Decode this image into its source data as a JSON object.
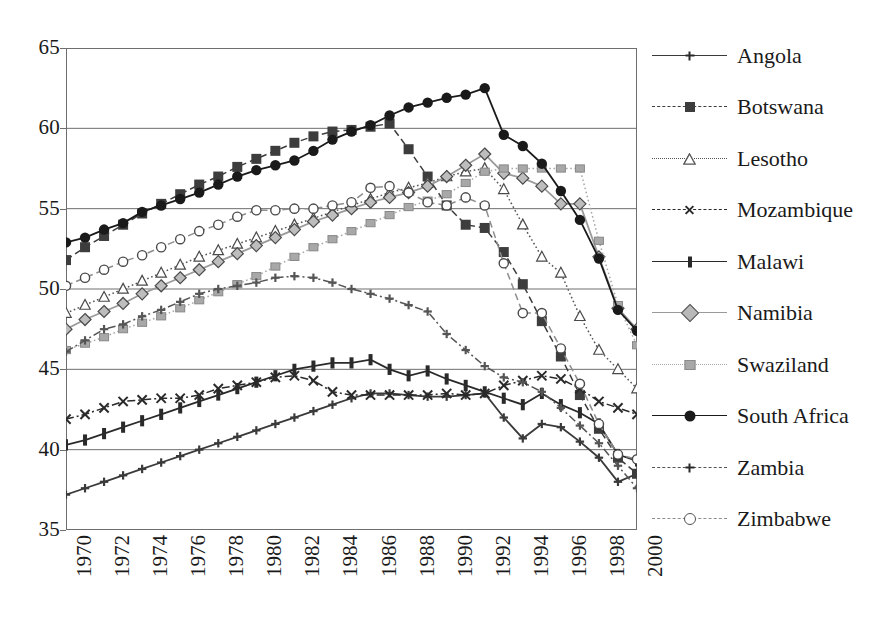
{
  "chart_data": {
    "type": "line",
    "title": "",
    "xlabel": "",
    "ylabel": "",
    "xlim": [
      1970,
      2000
    ],
    "ylim": [
      35,
      65
    ],
    "yticks": [
      35,
      40,
      45,
      50,
      55,
      60,
      65
    ],
    "xticks": [
      1970,
      1972,
      1974,
      1976,
      1978,
      1980,
      1982,
      1984,
      1986,
      1988,
      1990,
      1992,
      1994,
      1996,
      1998,
      2000
    ],
    "grid": true,
    "legend_position": "right",
    "x": [
      1970,
      1971,
      1972,
      1973,
      1974,
      1975,
      1976,
      1977,
      1978,
      1979,
      1980,
      1981,
      1982,
      1983,
      1984,
      1985,
      1986,
      1987,
      1988,
      1989,
      1990,
      1991,
      1992,
      1993,
      1994,
      1995,
      1996,
      1997,
      1998,
      1999,
      2000
    ],
    "series": [
      {
        "name": "Angola",
        "marker": "plus",
        "dash": "solid",
        "color": "#3a3a3a",
        "values": [
          37.2,
          37.6,
          38.0,
          38.4,
          38.8,
          39.2,
          39.6,
          40.0,
          40.4,
          40.8,
          41.2,
          41.6,
          42.0,
          42.4,
          42.8,
          43.2,
          43.5,
          43.5,
          43.4,
          43.3,
          43.3,
          43.4,
          43.5,
          42.0,
          40.7,
          41.6,
          41.4,
          40.5,
          39.5,
          38.0,
          38.5
        ]
      },
      {
        "name": "Botswana",
        "marker": "filled-square",
        "dash": "dashed",
        "color": "#3d3d3d",
        "values": [
          51.8,
          52.6,
          53.3,
          54.0,
          54.7,
          55.3,
          55.9,
          56.5,
          57.0,
          57.6,
          58.1,
          58.6,
          59.1,
          59.5,
          59.8,
          59.9,
          60.1,
          60.3,
          58.7,
          57.0,
          55.2,
          54.0,
          53.8,
          52.3,
          50.3,
          48.0,
          45.8,
          43.4,
          41.3,
          39.5,
          38.5
        ]
      },
      {
        "name": "Lesotho",
        "marker": "open-triangle",
        "dash": "dotted",
        "color": "#555555",
        "values": [
          48.5,
          49.0,
          49.5,
          50.0,
          50.5,
          51.0,
          51.5,
          52.0,
          52.4,
          52.8,
          53.2,
          53.6,
          54.0,
          54.4,
          54.8,
          55.2,
          55.6,
          56.0,
          56.3,
          56.6,
          57.0,
          57.3,
          57.5,
          56.2,
          54.0,
          52.0,
          51.0,
          48.3,
          46.2,
          45.0,
          43.8
        ]
      },
      {
        "name": "Mozambique",
        "marker": "x",
        "dash": "dash-dot",
        "color": "#2a2a2a",
        "values": [
          41.9,
          42.2,
          42.6,
          43.0,
          43.1,
          43.2,
          43.2,
          43.4,
          43.8,
          44.0,
          44.2,
          44.5,
          44.6,
          44.3,
          43.6,
          43.4,
          43.4,
          43.4,
          43.4,
          43.4,
          43.5,
          43.4,
          43.5,
          44.0,
          44.3,
          44.6,
          44.4,
          43.8,
          43.0,
          42.6,
          42.2
        ]
      },
      {
        "name": "Malawi",
        "marker": "vbar",
        "dash": "solid",
        "color": "#2a2a2a",
        "values": [
          40.3,
          40.6,
          41.0,
          41.4,
          41.8,
          42.2,
          42.6,
          43.0,
          43.4,
          43.8,
          44.2,
          44.6,
          45.0,
          45.2,
          45.4,
          45.4,
          45.6,
          45.0,
          44.6,
          44.9,
          44.4,
          44.0,
          43.6,
          43.2,
          42.8,
          43.5,
          42.8,
          42.3,
          41.6,
          39.7,
          39.3
        ]
      },
      {
        "name": "Namibia",
        "marker": "diamond",
        "dash": "solid",
        "color": "#9a9a9a",
        "values": [
          47.5,
          48.1,
          48.6,
          49.1,
          49.7,
          50.2,
          50.7,
          51.2,
          51.7,
          52.2,
          52.7,
          53.2,
          53.7,
          54.2,
          54.6,
          55.0,
          55.4,
          55.7,
          56.0,
          56.4,
          57.0,
          57.7,
          58.4,
          57.2,
          56.9,
          56.4,
          55.3,
          55.3,
          52.0,
          48.8,
          47.5
        ]
      },
      {
        "name": "Swaziland",
        "marker": "gray-square",
        "dash": "dotted",
        "color": "#a8a8a8",
        "values": [
          46.2,
          46.6,
          47.0,
          47.5,
          47.9,
          48.3,
          48.8,
          49.3,
          49.8,
          50.3,
          50.8,
          51.4,
          52.0,
          52.6,
          53.1,
          53.6,
          54.1,
          54.6,
          55.1,
          55.5,
          55.9,
          56.6,
          57.3,
          57.5,
          57.5,
          57.5,
          57.5,
          57.5,
          53.0,
          49.0,
          46.5
        ]
      },
      {
        "name": "South Africa",
        "marker": "filled-circle",
        "dash": "solid",
        "color": "#1a1a1a",
        "values": [
          52.9,
          53.2,
          53.7,
          54.1,
          54.8,
          55.2,
          55.6,
          56.0,
          56.5,
          57.0,
          57.4,
          57.7,
          58.0,
          58.6,
          59.3,
          59.8,
          60.2,
          60.8,
          61.3,
          61.6,
          61.9,
          62.1,
          62.5,
          59.6,
          58.9,
          57.8,
          56.1,
          54.3,
          51.9,
          48.7,
          47.4
        ]
      },
      {
        "name": "Zambia",
        "marker": "plus",
        "dash": "dash-dot",
        "color": "#555555",
        "values": [
          46.1,
          46.8,
          47.5,
          47.8,
          48.3,
          48.7,
          49.2,
          49.7,
          50.0,
          50.2,
          50.4,
          50.7,
          50.8,
          50.7,
          50.4,
          50.0,
          49.7,
          49.4,
          49.0,
          48.6,
          47.2,
          46.2,
          45.2,
          44.5,
          44.2,
          43.6,
          42.6,
          41.5,
          40.4,
          39.0,
          37.6
        ]
      },
      {
        "name": "Zimbabwe",
        "marker": "open-circle",
        "dash": "dashed",
        "color": "#8d8d8d",
        "values": [
          50.2,
          50.7,
          51.2,
          51.7,
          52.1,
          52.6,
          53.1,
          53.6,
          54.0,
          54.5,
          54.9,
          54.9,
          55.0,
          55.0,
          55.2,
          55.4,
          56.3,
          56.4,
          56.0,
          55.4,
          55.2,
          55.7,
          55.2,
          51.6,
          48.5,
          48.5,
          46.3,
          44.1,
          41.6,
          39.7,
          39.4
        ]
      }
    ]
  },
  "legend": {
    "items": [
      {
        "label": "Angola",
        "key": "angola-key"
      },
      {
        "label": "Botswana",
        "key": "botswana-key"
      },
      {
        "label": "Lesotho",
        "key": "lesotho-key"
      },
      {
        "label": "Mozambique",
        "key": "mozambique-key"
      },
      {
        "label": "Malawi",
        "key": "malawi-key"
      },
      {
        "label": "Namibia",
        "key": "namibia-key"
      },
      {
        "label": "Swaziland",
        "key": "swaziland-key"
      },
      {
        "label": "South Africa",
        "key": "south-africa-key"
      },
      {
        "label": "Zambia",
        "key": "zambia-key"
      },
      {
        "label": "Zimbabwe",
        "key": "zimbabwe-key"
      }
    ]
  },
  "colors": {
    "frame": "#6e6e6e",
    "grid": "#6e6e6e",
    "text": "#1a1a1a",
    "background": "#ffffff"
  }
}
